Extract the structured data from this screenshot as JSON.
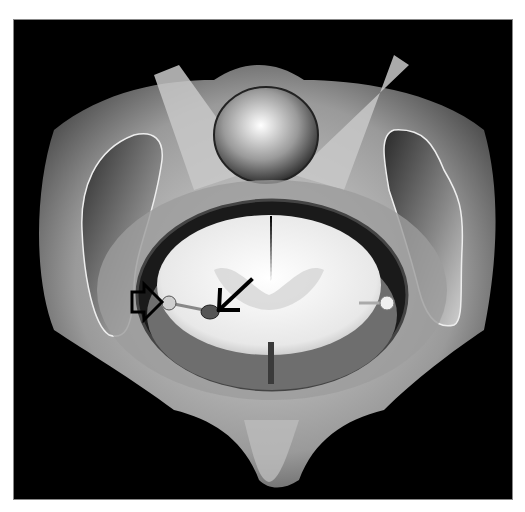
{
  "figure": {
    "background_color": "#000000",
    "page_color": "#ffffff",
    "annotations": [
      {
        "type": "open-arrow",
        "direction": "right",
        "points_to": "nerve root exit at dural sleeve (left)"
      },
      {
        "type": "line-arrow",
        "direction": "down-left",
        "points_to": "nerve rootlet bulb (left)"
      }
    ]
  }
}
